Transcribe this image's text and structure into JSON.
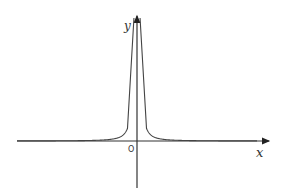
{
  "figure": {
    "x_label": "x",
    "y_label": "y",
    "origin_label": "O",
    "curve": "y = k/x² style, symmetric about y-axis, approaching x-axis asymptotically",
    "color": "#333333"
  }
}
